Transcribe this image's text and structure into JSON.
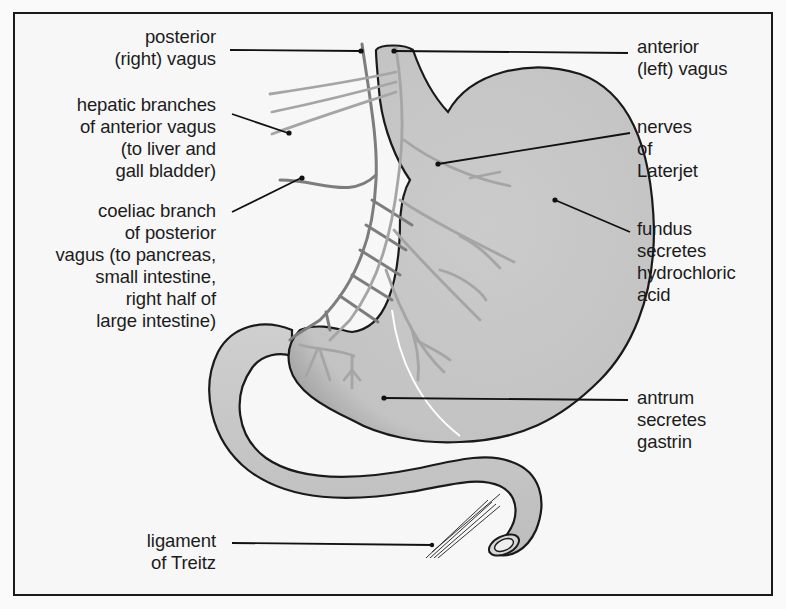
{
  "diagram": {
    "colors": {
      "background": "#f7f7f7",
      "frame": "#1a1a1a",
      "stomach_fill": "#c8c8c8",
      "outline": "#1a1a1a",
      "nerve_dark": "#7a7a7a",
      "nerve_light": "#a9a9a9",
      "label_text": "#1c1c1c"
    },
    "labels_left": [
      {
        "id": "posterior-vagus",
        "text": "posterior\n(right) vagus"
      },
      {
        "id": "hepatic-branches",
        "text": "hepatic branches\nof anterior vagus\n(to liver and\ngall bladder)"
      },
      {
        "id": "coeliac-branch",
        "text": "coeliac branch\nof posterior\nvagus (to pancreas,\nsmall intestine,\nright half of\nlarge intestine)"
      },
      {
        "id": "ligament-treitz",
        "text": "ligament\nof Treitz"
      }
    ],
    "labels_right": [
      {
        "id": "anterior-vagus",
        "text": "anterior\n(left) vagus"
      },
      {
        "id": "nerves-laterjet",
        "text": "nerves\nof\nLaterjet"
      },
      {
        "id": "fundus",
        "text": "fundus\nsecretes\nhydrochloric\nacid"
      },
      {
        "id": "antrum",
        "text": "antrum\nsecretes\ngastrin"
      }
    ]
  }
}
